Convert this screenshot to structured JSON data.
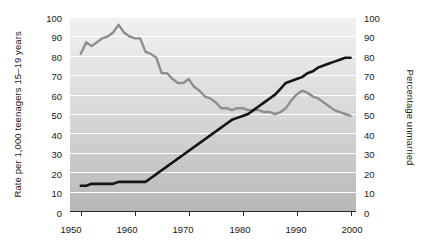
{
  "chart_data": {
    "type": "line",
    "title": "",
    "xlabel": "",
    "ylabel": "Rate per 1,000 teenagers 15–19 years",
    "ylabel_right": "Percentage unmarried",
    "xlim": [
      1948,
      2001
    ],
    "ylim": [
      0,
      100
    ],
    "ylim_right": [
      0,
      100
    ],
    "grid": true,
    "legend_position": "inline-annotations",
    "xticks": [
      1950,
      1960,
      1970,
      1980,
      1990,
      2000
    ],
    "xticklabels": [
      "1950",
      "1960",
      "1970",
      "1980",
      "1990",
      "2000"
    ],
    "yticks": [
      0,
      10,
      20,
      30,
      40,
      50,
      60,
      70,
      80,
      90,
      100
    ],
    "yticklabels": [
      "0",
      "10",
      "20",
      "30",
      "40",
      "50",
      "60",
      "70",
      "80",
      "90",
      "100"
    ],
    "yticks_right": [
      0,
      10,
      20,
      30,
      40,
      50,
      60,
      70,
      80,
      90,
      100
    ],
    "yticklabels_right": [
      "0",
      "10",
      "20",
      "30",
      "40",
      "50",
      "60",
      "70",
      "80",
      "90",
      "100"
    ],
    "series": [
      {
        "name": "Birthrate",
        "color": "#8e8e8e",
        "axis": "left",
        "annotation": "Birthrate",
        "x": [
          1950,
          1951,
          1952,
          1953,
          1954,
          1955,
          1956,
          1957,
          1958,
          1959,
          1960,
          1961,
          1962,
          1963,
          1964,
          1965,
          1966,
          1967,
          1968,
          1969,
          1970,
          1971,
          1972,
          1973,
          1974,
          1975,
          1976,
          1977,
          1978,
          1979,
          1980,
          1981,
          1982,
          1983,
          1984,
          1985,
          1986,
          1987,
          1988,
          1989,
          1990,
          1991,
          1992,
          1993,
          1994,
          1995,
          1996,
          1997,
          1998,
          1999,
          2000
        ],
        "values": [
          81,
          87,
          85,
          87,
          89,
          90,
          92,
          96,
          92,
          90,
          89,
          89,
          82,
          81,
          79,
          71,
          71,
          68,
          66,
          66,
          68,
          64,
          62,
          59,
          58,
          56,
          53,
          53,
          52,
          53,
          53,
          52,
          52,
          52,
          51,
          51,
          50,
          51,
          53,
          57,
          60,
          62,
          61,
          59,
          58,
          56,
          54,
          52,
          51,
          50,
          49
        ]
      },
      {
        "name": "Percent unmarried",
        "color": "#151515",
        "axis": "right",
        "annotation": "Percent unmarried",
        "x": [
          1950,
          1951,
          1952,
          1953,
          1954,
          1955,
          1956,
          1957,
          1958,
          1959,
          1960,
          1961,
          1962,
          1963,
          1964,
          1965,
          1966,
          1967,
          1968,
          1969,
          1970,
          1971,
          1972,
          1973,
          1974,
          1975,
          1976,
          1977,
          1978,
          1979,
          1980,
          1981,
          1982,
          1983,
          1984,
          1985,
          1986,
          1987,
          1988,
          1989,
          1990,
          1991,
          1992,
          1993,
          1994,
          1995,
          1996,
          1997,
          1998,
          1999,
          2000
        ],
        "values": [
          13,
          13,
          14,
          14,
          14,
          14,
          14,
          15,
          15,
          15,
          15,
          15,
          15,
          17,
          19,
          21,
          23,
          25,
          27,
          29,
          31,
          33,
          35,
          37,
          39,
          41,
          43,
          45,
          47,
          48,
          49,
          50,
          52,
          54,
          56,
          58,
          60,
          63,
          66,
          67,
          68,
          69,
          71,
          72,
          74,
          75,
          76,
          77,
          78,
          79,
          79
        ]
      }
    ]
  },
  "plot": {
    "background_top_color": "#efefef",
    "background_bottom_color": "#b9b9b9",
    "gridline_color": "#ffffff",
    "axis_color": "#2b2b2b"
  }
}
